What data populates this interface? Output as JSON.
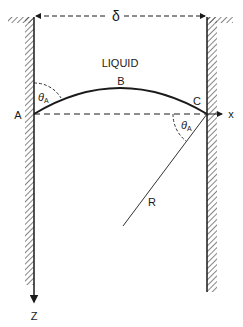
{
  "diagram": {
    "labels": {
      "delta": "δ",
      "liquid": "LIQUID",
      "point_a": "A",
      "point_b": "B",
      "point_c": "C",
      "theta_left": "θ",
      "theta_left_sub": "A",
      "theta_right": "θ",
      "theta_right_sub": "A",
      "radius": "R",
      "x_axis": "x",
      "z_axis": "Z"
    },
    "colors": {
      "ink": "#1a1a1a",
      "background": "#ffffff"
    }
  }
}
